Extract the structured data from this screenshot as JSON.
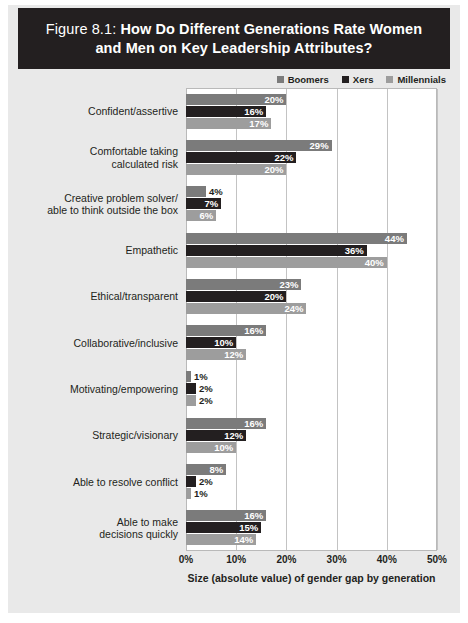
{
  "figure": {
    "number": "Figure 8.1:",
    "title": "How Do Different Generations Rate Women and Men on Key Leadership Attributes?"
  },
  "legend": {
    "position": "top-right",
    "items": [
      {
        "label": "Boomers",
        "color": "#7b7b7b"
      },
      {
        "label": "Xers",
        "color": "#231f20"
      },
      {
        "label": "Millennials",
        "color": "#9d9d9d"
      }
    ]
  },
  "axis": {
    "ticks": [
      "0%",
      "10%",
      "20%",
      "30%",
      "40%",
      "50%"
    ],
    "title": "Size (absolute value) of gender gap by generation"
  },
  "chart_data": {
    "type": "bar",
    "orientation": "horizontal",
    "title": "Figure 8.1: How Do Different Generations Rate Women and Men on Key Leadership Attributes?",
    "xlabel": "Size (absolute value) of gender gap by generation",
    "ylabel": "",
    "xlim": [
      0,
      50
    ],
    "xticks": [
      0,
      10,
      20,
      30,
      40,
      50
    ],
    "xtick_labels": [
      "0%",
      "10%",
      "20%",
      "30%",
      "40%",
      "50%"
    ],
    "grid": "vertical",
    "legend_position": "top-right",
    "value_suffix": "%",
    "categories": [
      "Confident/assertive",
      "Comfortable taking calculated risk",
      "Creative problem solver/ able to think outside the box",
      "Empathetic",
      "Ethical/transparent",
      "Collaborative/inclusive",
      "Motivating/empowering",
      "Strategic/visionary",
      "Able to resolve conflict",
      "Able to make decisions quickly"
    ],
    "series": [
      {
        "name": "Boomers",
        "color": "#7b7b7b",
        "values": [
          20,
          29,
          4,
          44,
          23,
          16,
          1,
          16,
          8,
          16
        ]
      },
      {
        "name": "Xers",
        "color": "#231f20",
        "values": [
          16,
          22,
          7,
          36,
          20,
          10,
          2,
          12,
          2,
          15
        ]
      },
      {
        "name": "Millennials",
        "color": "#9d9d9d",
        "values": [
          17,
          20,
          6,
          40,
          24,
          12,
          2,
          10,
          1,
          14
        ]
      }
    ]
  },
  "rows": [
    {
      "label_lines": [
        "Confident/assertive"
      ],
      "values": [
        20,
        16,
        17
      ]
    },
    {
      "label_lines": [
        "Comfortable taking",
        "calculated risk"
      ],
      "values": [
        29,
        22,
        20
      ]
    },
    {
      "label_lines": [
        "Creative problem solver/",
        "able to think outside the box"
      ],
      "values": [
        4,
        7,
        6
      ]
    },
    {
      "label_lines": [
        "Empathetic"
      ],
      "values": [
        44,
        36,
        40
      ]
    },
    {
      "label_lines": [
        "Ethical/transparent"
      ],
      "values": [
        23,
        20,
        24
      ]
    },
    {
      "label_lines": [
        "Collaborative/inclusive"
      ],
      "values": [
        16,
        10,
        12
      ]
    },
    {
      "label_lines": [
        "Motivating/empowering"
      ],
      "values": [
        1,
        2,
        2
      ]
    },
    {
      "label_lines": [
        "Strategic/visionary"
      ],
      "values": [
        16,
        12,
        10
      ]
    },
    {
      "label_lines": [
        "Able to resolve conflict"
      ],
      "values": [
        8,
        2,
        1
      ]
    },
    {
      "label_lines": [
        "Able to make",
        "decisions quickly"
      ],
      "values": [
        16,
        15,
        14
      ]
    }
  ]
}
